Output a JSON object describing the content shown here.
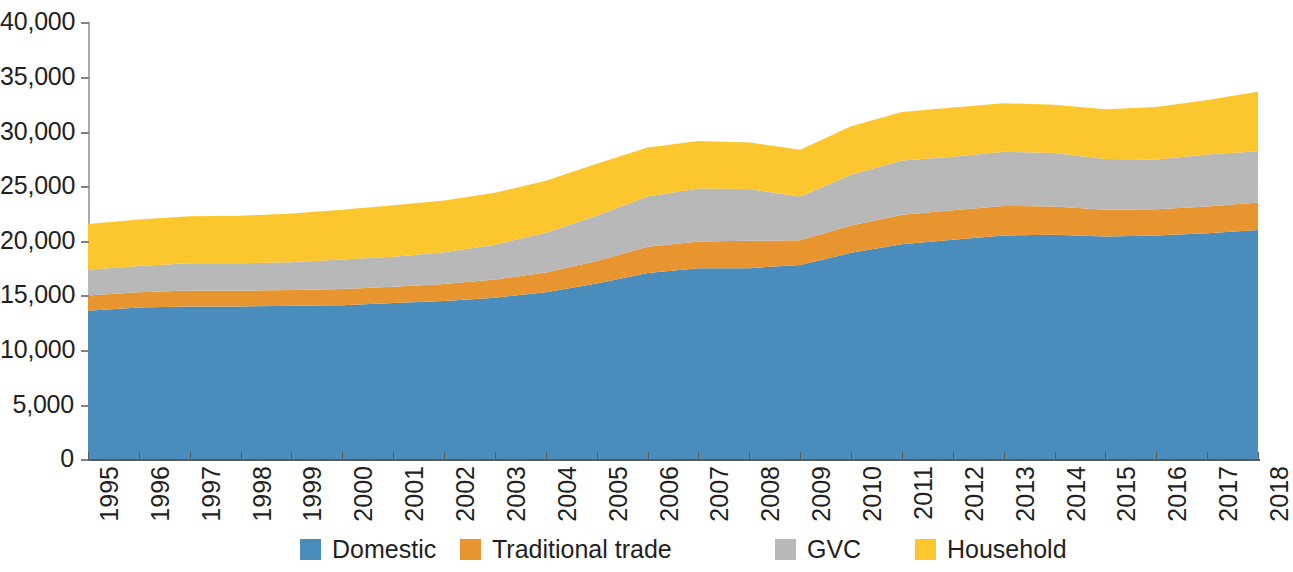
{
  "chart_data": {
    "type": "area",
    "stacked": true,
    "title": "",
    "subtitle": "",
    "xlabel": "",
    "ylabel": "",
    "grid": false,
    "legend_position": "bottom",
    "xlim": [
      1995,
      2018
    ],
    "ylim": [
      0,
      40000
    ],
    "y_ticks": [
      0,
      5000,
      10000,
      15000,
      20000,
      25000,
      30000,
      35000,
      40000
    ],
    "y_tick_labels": [
      "0",
      "5,000",
      "10,000",
      "15,000",
      "20,000",
      "25,000",
      "30,000",
      "35,000",
      "40,000"
    ],
    "categories": [
      1995,
      1996,
      1997,
      1998,
      1999,
      2000,
      2001,
      2002,
      2003,
      2004,
      2005,
      2006,
      2007,
      2008,
      2009,
      2010,
      2011,
      2012,
      2013,
      2014,
      2015,
      2016,
      2017,
      2018
    ],
    "x_tick_labels": [
      "1995",
      "1996",
      "1997",
      "1998",
      "1999",
      "2000",
      "2001",
      "2002",
      "2003",
      "2004",
      "2005",
      "2006",
      "2007",
      "2008",
      "2009",
      "2010",
      "2011",
      "2012",
      "2013",
      "2014",
      "2015",
      "2016",
      "2017",
      "2018"
    ],
    "series": [
      {
        "name": "Domestic",
        "color": "#4a8dbc",
        "values": [
          13600,
          13900,
          14000,
          14000,
          14050,
          14100,
          14300,
          14500,
          14800,
          15300,
          16100,
          17050,
          17500,
          17500,
          17800,
          18900,
          19700,
          20100,
          20500,
          20550,
          20400,
          20500,
          20700,
          21000
        ]
      },
      {
        "name": "Traditional trade",
        "color": "#e8952f",
        "values": [
          1400,
          1400,
          1450,
          1450,
          1450,
          1500,
          1500,
          1550,
          1650,
          1800,
          2050,
          2400,
          2450,
          2500,
          2250,
          2500,
          2700,
          2700,
          2700,
          2600,
          2450,
          2400,
          2450,
          2500
        ]
      },
      {
        "name": "GVC",
        "color": "#b8b8b8",
        "values": [
          2350,
          2400,
          2500,
          2500,
          2550,
          2700,
          2750,
          2900,
          3200,
          3650,
          4150,
          4600,
          4850,
          4750,
          4000,
          4650,
          4950,
          4900,
          4950,
          4900,
          4650,
          4550,
          4750,
          4700
        ]
      },
      {
        "name": "Household",
        "color": "#fbc62e",
        "values": [
          4200,
          4250,
          4300,
          4350,
          4450,
          4550,
          4700,
          4750,
          4750,
          4750,
          4750,
          4500,
          4350,
          4250,
          4300,
          4450,
          4450,
          4500,
          4450,
          4400,
          4550,
          4800,
          5000,
          5450
        ]
      }
    ],
    "totals": [
      21550,
      21950,
      22250,
      22300,
      22500,
      22850,
      23250,
      23700,
      24400,
      25500,
      27050,
      28550,
      29150,
      29000,
      28350,
      30500,
      31800,
      32200,
      32600,
      32450,
      32050,
      32250,
      32900,
      33650
    ]
  },
  "legend": {
    "items": [
      {
        "label": "Domestic",
        "color": "#4a8dbc",
        "left": 300
      },
      {
        "label": "Traditional trade",
        "color": "#e8952f",
        "left": 460
      },
      {
        "label": "GVC",
        "color": "#b8b8b8",
        "left": 775
      },
      {
        "label": "Household",
        "color": "#fbc62e",
        "left": 915
      }
    ]
  }
}
